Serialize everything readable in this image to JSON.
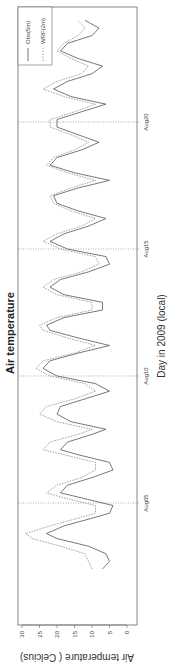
{
  "chart_data": {
    "type": "line",
    "title": "Air temperature",
    "xlabel": "Day in 2009  (local)",
    "ylabel": "Air  temperature ( Celcius)",
    "ylim": [
      0,
      30
    ],
    "yticks": [
      0,
      5,
      10,
      15,
      20,
      25,
      30
    ],
    "xticks": [
      {
        "label": "Aug05",
        "day": 5
      },
      {
        "label": "Aug10",
        "day": 10
      },
      {
        "label": "Aug15",
        "day": 15
      },
      {
        "label": "Aug20",
        "day": 20
      }
    ],
    "xlim_days": [
      1.8,
      24.6
    ],
    "grid": "dotted vertical lines at x ticks",
    "legend": {
      "position": "top-right",
      "entries": [
        "Obs(5m)",
        "WRF(2m)"
      ]
    },
    "series": [
      {
        "name": "Obs(5m)",
        "style": "solid",
        "color": "#555555",
        "points": [
          [
            2.4,
            7
          ],
          [
            2.7,
            5
          ],
          [
            3.0,
            6
          ],
          [
            3.3,
            11
          ],
          [
            3.6,
            20
          ],
          [
            3.8,
            23
          ],
          [
            4.1,
            18
          ],
          [
            4.4,
            10
          ],
          [
            4.6,
            5
          ],
          [
            4.9,
            4
          ],
          [
            5.2,
            13
          ],
          [
            5.4,
            19
          ],
          [
            5.7,
            17
          ],
          [
            6.0,
            10
          ],
          [
            6.3,
            4
          ],
          [
            6.6,
            5
          ],
          [
            6.9,
            14
          ],
          [
            7.1,
            19
          ],
          [
            7.4,
            17
          ],
          [
            7.7,
            10
          ],
          [
            7.9,
            6
          ],
          [
            8.2,
            16
          ],
          [
            8.5,
            20
          ],
          [
            8.8,
            19
          ],
          [
            9.1,
            12
          ],
          [
            9.4,
            5
          ],
          [
            9.7,
            9
          ],
          [
            10.0,
            20
          ],
          [
            10.3,
            24
          ],
          [
            10.6,
            22
          ],
          [
            10.9,
            14
          ],
          [
            11.2,
            5
          ],
          [
            11.5,
            14
          ],
          [
            11.8,
            22
          ],
          [
            12.0,
            23
          ],
          [
            12.3,
            18
          ],
          [
            12.6,
            7
          ],
          [
            12.9,
            7
          ],
          [
            13.2,
            18
          ],
          [
            13.5,
            22
          ],
          [
            13.8,
            19
          ],
          [
            14.1,
            11
          ],
          [
            14.4,
            5
          ],
          [
            14.7,
            6
          ],
          [
            15.0,
            17
          ],
          [
            15.3,
            22
          ],
          [
            15.6,
            18
          ],
          [
            15.9,
            11
          ],
          [
            16.2,
            6
          ],
          [
            16.5,
            14
          ],
          [
            16.8,
            20
          ],
          [
            17.1,
            21
          ],
          [
            17.4,
            14
          ],
          [
            17.7,
            5
          ],
          [
            18.0,
            15
          ],
          [
            18.3,
            22
          ],
          [
            18.6,
            20
          ],
          [
            18.9,
            13
          ],
          [
            19.2,
            8
          ],
          [
            19.5,
            14
          ],
          [
            19.8,
            20
          ],
          [
            20.1,
            20
          ],
          [
            20.4,
            13
          ],
          [
            20.7,
            6
          ],
          [
            21.0,
            16
          ],
          [
            21.3,
            21
          ],
          [
            21.6,
            17
          ],
          [
            21.9,
            10
          ],
          [
            22.2,
            7
          ],
          [
            22.5,
            14
          ],
          [
            22.8,
            19
          ],
          [
            23.1,
            17
          ],
          [
            23.4,
            10
          ],
          [
            23.7,
            8
          ],
          [
            24.0,
            12
          ]
        ]
      },
      {
        "name": "WRF(2m)",
        "style": "dashed",
        "color": "#888888",
        "points": [
          [
            2.4,
            10
          ],
          [
            2.7,
            11
          ],
          [
            3.0,
            12
          ],
          [
            3.3,
            19
          ],
          [
            3.6,
            27
          ],
          [
            3.8,
            29
          ],
          [
            4.1,
            22
          ],
          [
            4.4,
            14
          ],
          [
            4.6,
            9
          ],
          [
            4.9,
            9
          ],
          [
            5.2,
            18
          ],
          [
            5.4,
            23
          ],
          [
            5.7,
            20
          ],
          [
            6.0,
            13
          ],
          [
            6.3,
            9
          ],
          [
            6.6,
            9
          ],
          [
            6.9,
            18
          ],
          [
            7.1,
            24
          ],
          [
            7.4,
            22
          ],
          [
            7.7,
            14
          ],
          [
            7.9,
            10
          ],
          [
            8.2,
            20
          ],
          [
            8.5,
            25
          ],
          [
            8.8,
            23
          ],
          [
            9.1,
            15
          ],
          [
            9.4,
            9
          ],
          [
            9.7,
            12
          ],
          [
            10.0,
            22
          ],
          [
            10.3,
            26
          ],
          [
            10.6,
            24
          ],
          [
            10.9,
            15
          ],
          [
            11.2,
            9
          ],
          [
            11.5,
            17
          ],
          [
            11.8,
            24
          ],
          [
            12.0,
            25
          ],
          [
            12.3,
            20
          ],
          [
            12.6,
            10
          ],
          [
            12.9,
            10
          ],
          [
            13.2,
            20
          ],
          [
            13.5,
            24
          ],
          [
            13.8,
            21
          ],
          [
            14.1,
            13
          ],
          [
            14.4,
            8
          ],
          [
            14.7,
            9
          ],
          [
            15.0,
            19
          ],
          [
            15.3,
            24
          ],
          [
            15.6,
            20
          ],
          [
            15.9,
            13
          ],
          [
            16.2,
            9
          ],
          [
            16.5,
            16
          ],
          [
            16.8,
            21
          ],
          [
            17.1,
            22
          ],
          [
            17.4,
            16
          ],
          [
            17.7,
            9
          ],
          [
            18.0,
            17
          ],
          [
            18.3,
            23
          ],
          [
            18.6,
            21
          ],
          [
            18.9,
            15
          ],
          [
            19.2,
            11
          ],
          [
            19.5,
            16
          ],
          [
            19.8,
            22
          ],
          [
            20.1,
            22
          ],
          [
            20.4,
            15
          ],
          [
            20.7,
            9
          ],
          [
            21.0,
            18
          ],
          [
            21.3,
            24
          ],
          [
            21.6,
            20
          ],
          [
            21.9,
            13
          ],
          [
            22.2,
            11
          ],
          [
            22.5,
            16
          ],
          [
            22.8,
            20
          ],
          [
            23.1,
            18
          ],
          [
            23.4,
            14
          ],
          [
            23.7,
            12
          ],
          [
            24.0,
            14
          ]
        ]
      }
    ]
  }
}
